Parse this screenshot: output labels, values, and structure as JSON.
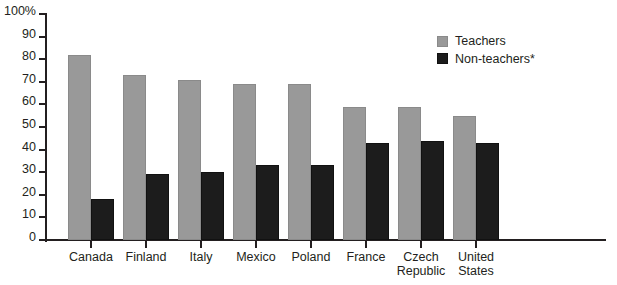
{
  "chart_data": {
    "type": "bar",
    "title": "",
    "subtitle": "",
    "xlabel": "",
    "ylabel": "",
    "ylim": [
      0,
      100
    ],
    "grid": false,
    "legend_position": "top-right",
    "categories": [
      "Canada",
      "Finland",
      "Italy",
      "Mexico",
      "Poland",
      "France",
      "Czech\nRepublic",
      "United\nStates"
    ],
    "y_ticks": [
      "0",
      "10",
      "20",
      "30",
      "40",
      "50",
      "60",
      "70",
      "80",
      "90",
      "100%"
    ],
    "y_tick_values": [
      0,
      10,
      20,
      30,
      40,
      50,
      60,
      70,
      80,
      90,
      100
    ],
    "series": [
      {
        "name": "Teachers",
        "color": "#999999",
        "values": [
          82,
          73,
          71,
          69,
          69,
          59,
          59,
          55
        ]
      },
      {
        "name": "Non-teachers*",
        "color": "#1c1c1c",
        "values": [
          18,
          29,
          30,
          33,
          33,
          43,
          44,
          43
        ]
      }
    ]
  },
  "legend": {
    "items": [
      {
        "label": "Teachers",
        "swatch": "teachers"
      },
      {
        "label": "Non-teachers*",
        "swatch": "nonteachers"
      }
    ]
  },
  "colors": {
    "teachers": "#999999",
    "nonteachers": "#1c1c1c",
    "axis": "#231f20",
    "background": "#ffffff"
  }
}
